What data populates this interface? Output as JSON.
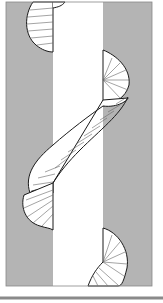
{
  "figure": {
    "colors": {
      "background": "#ffffff",
      "panel": "#b4b4b4",
      "band": "#ffffff",
      "coil_fill": "#ffffff",
      "outline": "#1a1a1a",
      "rib": "#555555",
      "footer_line": "#8a8a8a"
    }
  }
}
